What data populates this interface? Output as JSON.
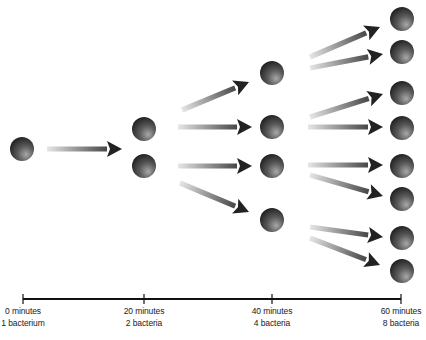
{
  "diagram": {
    "colors": {
      "ball_highlight": "#a8a8a8",
      "ball_mid": "#5a5a5a",
      "ball_dark": "#1a1a1a",
      "arrow_dark": "#222222",
      "arrow_light": "#e6e6e6",
      "timeline": "#111111",
      "background": "#ffffff"
    },
    "ball_radius": 12,
    "generations": [
      {
        "time_label": "0 minutes",
        "count_label": "1 bacterium",
        "x": 22,
        "balls": [
          149
        ]
      },
      {
        "time_label": "20 minutes",
        "count_label": "2 bacteria",
        "x": 144,
        "balls": [
          129,
          166
        ]
      },
      {
        "time_label": "40 minutes",
        "count_label": "4 bacteria",
        "x": 272,
        "balls": [
          73,
          127,
          166,
          220
        ]
      },
      {
        "time_label": "60 minutes",
        "count_label": "8 bacteria",
        "x": 402,
        "balls": [
          19,
          52,
          93,
          128,
          166,
          199,
          238,
          271
        ]
      }
    ],
    "arrows": [
      {
        "x1": 47,
        "y1": 149,
        "x2": 122,
        "y2": 149
      },
      {
        "x1": 182,
        "y1": 110,
        "x2": 249,
        "y2": 82
      },
      {
        "x1": 178,
        "y1": 127,
        "x2": 252,
        "y2": 127
      },
      {
        "x1": 178,
        "y1": 166,
        "x2": 252,
        "y2": 166
      },
      {
        "x1": 180,
        "y1": 183,
        "x2": 249,
        "y2": 212
      },
      {
        "x1": 310,
        "y1": 57,
        "x2": 380,
        "y2": 27
      },
      {
        "x1": 310,
        "y1": 68,
        "x2": 383,
        "y2": 54
      },
      {
        "x1": 310,
        "y1": 117,
        "x2": 383,
        "y2": 94
      },
      {
        "x1": 308,
        "y1": 127,
        "x2": 383,
        "y2": 127
      },
      {
        "x1": 308,
        "y1": 165,
        "x2": 383,
        "y2": 165
      },
      {
        "x1": 310,
        "y1": 175,
        "x2": 383,
        "y2": 196
      },
      {
        "x1": 310,
        "y1": 227,
        "x2": 383,
        "y2": 237
      },
      {
        "x1": 310,
        "y1": 238,
        "x2": 380,
        "y2": 265
      }
    ],
    "timeline": {
      "y": 299,
      "x_start": 23,
      "x_end": 401,
      "ticks": [
        23,
        144,
        272,
        401
      ],
      "labels": [
        {
          "line1": "0 minutes",
          "line2": "1 bacterium",
          "x": 23
        },
        {
          "line1": "20 minutes",
          "line2": "2 bacteria",
          "x": 144
        },
        {
          "line1": "40 minutes",
          "line2": "4 bacteria",
          "x": 272
        },
        {
          "line1": "60 minutes",
          "line2": "8 bacteria",
          "x": 401
        }
      ]
    }
  }
}
